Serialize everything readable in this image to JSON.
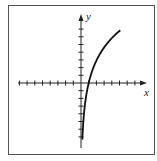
{
  "graph": {
    "function": "y = ln(x)",
    "x_axis_label": "x",
    "y_axis_label": "y",
    "x_ticks_negative": 8,
    "x_ticks_positive": 7,
    "y_ticks_positive": 7,
    "y_ticks_negative": 7,
    "x_intercept": 1,
    "colors": {
      "axis": "#222222",
      "curve": "#111111",
      "frame": "#555555"
    }
  },
  "chart_data": {
    "type": "line",
    "title": "",
    "xlabel": "x",
    "ylabel": "y",
    "xlim": [
      -8,
      8
    ],
    "ylim": [
      -8,
      8
    ],
    "grid": false,
    "series": [
      {
        "name": "y = ln(x)",
        "x": [
          0.001,
          0.05,
          0.2,
          0.5,
          1,
          2,
          3,
          4,
          5
        ],
        "y": [
          -7,
          -3,
          -1.6,
          -0.7,
          0,
          0.7,
          1.1,
          1.4,
          1.6
        ]
      }
    ]
  }
}
